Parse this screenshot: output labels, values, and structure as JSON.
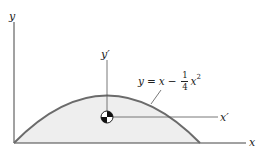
{
  "figure": {
    "axes": {
      "x_label": "x",
      "y_label": "y",
      "x_prime_label": "x′",
      "y_prime_label": "y′"
    },
    "equation": {
      "lhs": "y",
      "equals": "=",
      "term1": "x",
      "minus": "−",
      "frac_num": "1",
      "frac_den": "4",
      "term2": "x",
      "exponent": "2"
    },
    "colors": {
      "curve": "#6b6b6b",
      "fill": "#eeeeee",
      "axes": "#444444"
    }
  }
}
